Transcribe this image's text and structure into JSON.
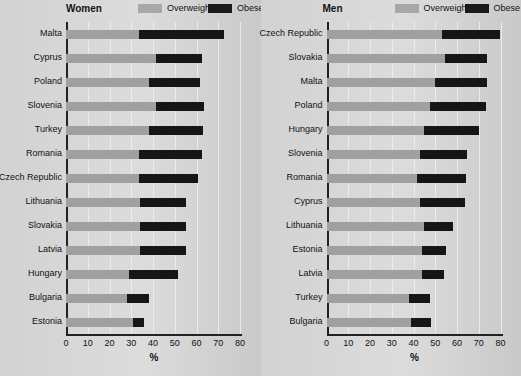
{
  "legend": {
    "overweight_label": "Overweight",
    "obese_label": "Obese",
    "overweight_color": "#a0a0a0",
    "obese_color": "#161616"
  },
  "axis": {
    "xlabel": "%",
    "ticks": [
      0,
      10,
      20,
      30,
      40,
      50,
      60,
      70,
      80
    ],
    "xmin": 0,
    "xmax": 80
  },
  "panels": [
    {
      "title": "Women"
    },
    {
      "title": "Men"
    }
  ],
  "chart_data": [
    {
      "type": "bar",
      "title": "Women",
      "orientation": "horizontal",
      "stacked": true,
      "xlabel": "%",
      "ylabel": "",
      "xlim": [
        0,
        80
      ],
      "grid": true,
      "legend_position": "top",
      "categories": [
        "Malta",
        "Cyprus",
        "Poland",
        "Slovenia",
        "Turkey",
        "Romania",
        "Czech Republic",
        "Lithuania",
        "Slovakia",
        "Latvia",
        "Hungary",
        "Bulgaria",
        "Estonia"
      ],
      "series": [
        {
          "name": "Overweight",
          "values": [
            33.5,
            41.5,
            38,
            41.5,
            38,
            33.5,
            33.5,
            34,
            34,
            34,
            29,
            28,
            31
          ]
        },
        {
          "name": "Obese",
          "values": [
            39,
            21,
            23.5,
            22,
            25,
            29,
            27,
            21,
            21,
            21,
            22.5,
            10,
            5
          ]
        }
      ],
      "totals": [
        72.5,
        62.5,
        61.5,
        63.5,
        63,
        62.5,
        60.5,
        55,
        55,
        55,
        51.5,
        38,
        36
      ]
    },
    {
      "type": "bar",
      "title": "Men",
      "orientation": "horizontal",
      "stacked": true,
      "xlabel": "%",
      "ylabel": "",
      "xlim": [
        0,
        80
      ],
      "grid": true,
      "legend_position": "top",
      "categories": [
        "Czech Republic",
        "Slovakia",
        "Malta",
        "Poland",
        "Hungary",
        "Slovenia",
        "Romania",
        "Cyprus",
        "Lithuania",
        "Estonia",
        "Latvia",
        "Turkey",
        "Bulgaria"
      ],
      "series": [
        {
          "name": "Overweight",
          "values": [
            53,
            54.5,
            50,
            47.5,
            45,
            43,
            41.5,
            43,
            45,
            44,
            44,
            38,
            39
          ]
        },
        {
          "name": "Obese",
          "values": [
            27,
            19.5,
            24,
            26,
            25,
            21.5,
            22.5,
            20.5,
            13,
            11,
            10,
            9.5,
            9
          ]
        }
      ],
      "totals": [
        80,
        74,
        74,
        73.5,
        70,
        64.5,
        64,
        63.5,
        58,
        55,
        54,
        47.5,
        48
      ]
    }
  ]
}
